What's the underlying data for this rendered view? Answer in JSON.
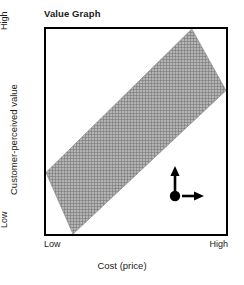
{
  "chart_data": {
    "type": "area",
    "title": "Value Graph",
    "xlabel": "Cost (price)",
    "ylabel": "Customer-perceived value",
    "x_ticks": [
      "Low",
      "High"
    ],
    "y_ticks": [
      "Low",
      "High"
    ],
    "xlim": [
      0,
      1
    ],
    "ylim": [
      0,
      1
    ],
    "grid": false,
    "legend": null,
    "series": [
      {
        "name": "Value equivalence band",
        "type": "band",
        "description": "Diagonal shaded band running from lower-left to upper-right, indicating the zone where customer-perceived value is proportional to cost (price).",
        "fill": "crosshatch-gray",
        "fill_color": "#a0a0a0",
        "upper_boundary": {
          "x": [
            0.0,
            0.81
          ],
          "y": [
            0.3,
            1.0
          ]
        },
        "lower_boundary": {
          "x": [
            0.15,
            1.0
          ],
          "y": [
            0.0,
            0.7
          ]
        }
      }
    ],
    "annotations": [
      {
        "name": "direction-indicator",
        "type": "axis-direction-glyph",
        "description": "Filled dot with an upward arrow and a rightward arrow indicating increasing direction of both axes.",
        "x": 0.71,
        "y": 0.19,
        "color": "#000000"
      }
    ]
  },
  "chart": {
    "title": "Value Graph",
    "x_axis": {
      "label": "Cost (price)",
      "low_label": "Low",
      "high_label": "High"
    },
    "y_axis": {
      "label": "Customer-perceived value",
      "low_label": "Low",
      "high_label": "High"
    }
  },
  "colors": {
    "frame": "#000000",
    "band": "#a0a0a0",
    "band_line": "#8c8c8c",
    "background": "#ffffff",
    "text": "#1a1a1a"
  }
}
